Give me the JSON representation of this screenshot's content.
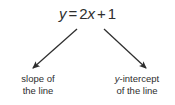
{
  "diagram": {
    "background_color": "#ffffff",
    "ink_color": "#2e2e2e",
    "equation": {
      "full_text": "y = 2x + 1",
      "lhs_variable": "y",
      "equals_sign": "=",
      "slope_coefficient": "2",
      "slope_variable": "x",
      "plus_sign": "+",
      "intercept_constant": "1"
    },
    "annotations": [
      {
        "id": "slope",
        "line1": "slope of",
        "line2": "the line",
        "points_to": "2",
        "arrow_direction": "down-left"
      },
      {
        "id": "y-intercept",
        "line1_prefix": "y",
        "line1_suffix": "-intercept",
        "line2": "of the line",
        "points_to": "1",
        "arrow_direction": "down-right"
      }
    ],
    "arrows": {
      "left": {
        "x1": 77,
        "y1": 29,
        "x2": 33,
        "y2": 68
      },
      "right": {
        "x1": 104,
        "y1": 29,
        "x2": 146,
        "y2": 68
      }
    }
  }
}
